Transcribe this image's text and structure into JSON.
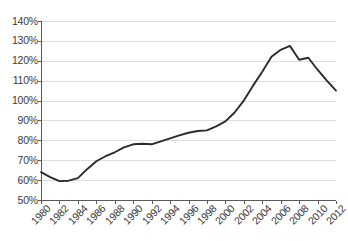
{
  "chart_data": {
    "type": "line",
    "title": "",
    "subtitle": "",
    "xlabel": "",
    "ylabel": "",
    "xlim": [
      1980,
      2012
    ],
    "ylim": [
      50,
      140
    ],
    "y_tick_step": 10,
    "x_tick_step": 2,
    "grid": "horizontal",
    "legend": "none",
    "value_suffix": "%",
    "y_ticks": [
      "140%",
      "130%",
      "120%",
      "110%",
      "100%",
      "90%",
      "80%",
      "70%",
      "60%",
      "50%"
    ],
    "y_tick_values": [
      140,
      130,
      120,
      110,
      100,
      90,
      80,
      70,
      60,
      50
    ],
    "x_ticks": [
      "1980",
      "1982",
      "1984",
      "1986",
      "1988",
      "1990",
      "1992",
      "1994",
      "1996",
      "1998",
      "2000",
      "2002",
      "2004",
      "2006",
      "2008",
      "2010",
      "2012"
    ],
    "x_tick_values": [
      1980,
      1982,
      1984,
      1986,
      1988,
      1990,
      1992,
      1994,
      1996,
      1998,
      2000,
      2002,
      2004,
      2006,
      2008,
      2010,
      2012
    ],
    "x": [
      1980,
      1981,
      1982,
      1983,
      1984,
      1985,
      1986,
      1987,
      1988,
      1989,
      1990,
      1991,
      1992,
      1993,
      1994,
      1995,
      1996,
      1997,
      1998,
      1999,
      2000,
      2001,
      2002,
      2003,
      2004,
      2005,
      2006,
      2007,
      2008,
      2009,
      2010,
      2011,
      2012
    ],
    "values": [
      64.0,
      61.5,
      59.5,
      59.7,
      61.0,
      65.5,
      69.5,
      72.0,
      74.0,
      76.5,
      78.0,
      78.3,
      78.0,
      79.5,
      81.0,
      82.5,
      83.8,
      84.7,
      85.0,
      87.0,
      89.5,
      94.0,
      100.0,
      107.5,
      114.5,
      122.0,
      125.5,
      127.5,
      120.5,
      121.5,
      115.5,
      110.0,
      105.0
    ],
    "series": [
      {
        "name": "ratio",
        "color": "#2b2b2b",
        "values": [
          64.0,
          61.5,
          59.5,
          59.7,
          61.0,
          65.5,
          69.5,
          72.0,
          74.0,
          76.5,
          78.0,
          78.3,
          78.0,
          79.5,
          81.0,
          82.5,
          83.8,
          84.7,
          85.0,
          87.0,
          89.5,
          94.0,
          100.0,
          107.5,
          114.5,
          122.0,
          125.5,
          127.5,
          120.5,
          121.5,
          115.5,
          110.0,
          105.0
        ]
      }
    ],
    "annotations": []
  },
  "style": {
    "grid_color": "#d6d6d6",
    "axis_color": "#5a5a5a",
    "line_color": "#2b2b2b",
    "background": "#ffffff",
    "tick_label_color": "#3a3a3a"
  }
}
